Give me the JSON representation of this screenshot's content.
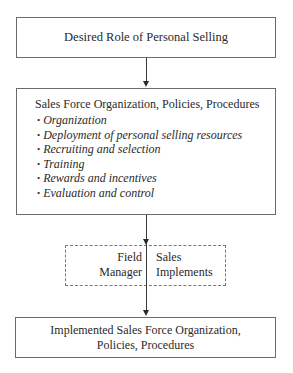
{
  "diagram": {
    "nodes": {
      "desired_role": {
        "label": "Desired Role of Personal Selling"
      },
      "org_policies": {
        "title": "Sales Force Organization, Policies, Procedures",
        "items": [
          "Organization",
          "Deployment of personal selling resources",
          "Recruiting and selection",
          "Training",
          "Rewards and incentives",
          "Evaluation and control"
        ],
        "bullet": "•"
      },
      "implementation": {
        "left_line1": "Field",
        "left_line2": "Manager",
        "right_line1": "Sales",
        "right_line2": "Implements"
      },
      "implemented": {
        "line1": "Implemented Sales Force Organization,",
        "line2": "Policies, Procedures"
      }
    },
    "edges": [
      {
        "from": "desired_role",
        "to": "org_policies"
      },
      {
        "from": "org_policies",
        "to": "implementation"
      },
      {
        "from": "implementation",
        "to": "implemented"
      }
    ],
    "colors": {
      "border": "#6b6b6b",
      "arrow": "#2a2a2a",
      "text": "#2a2a2a"
    }
  }
}
